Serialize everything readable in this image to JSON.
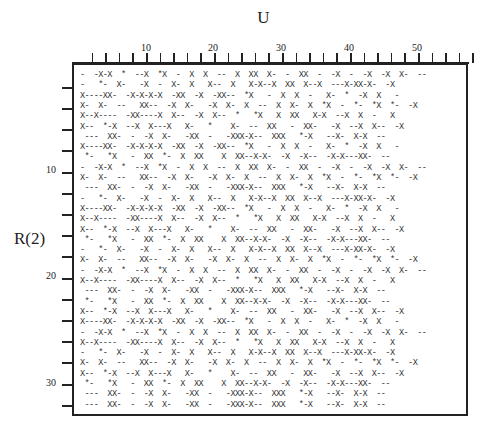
{
  "chart_data": {
    "type": "table",
    "title": "U",
    "xlabel": "U",
    "ylabel": "R(2)",
    "x_tick_labels": [
      "10",
      "20",
      "30",
      "40",
      "50"
    ],
    "y_tick_labels": [
      "10",
      "20",
      "30"
    ],
    "xlim": [
      1,
      58
    ],
    "ylim": [
      1,
      33
    ],
    "symbols": {
      "X": "x",
      "-": "dash",
      "*": "asterisk"
    },
    "patterns": {
      "P1": "-  -X-X  *  --X  *X  -  X  X  --  X  XX  X-  -  XX  -  -X  -  -X  -X  X-  --",
      "P2": "-   *-  X-   -X  -  X-  X   X--  X   X-X--X  XX  X--X  ---X-XX-X-  -X",
      "P3": "X----XX-  -X-X-X-X  -XX  -X  -XX--  *X   -  X  X  -   X-  *  -X  X   -",
      "P4": "X-  X-  --   XX--  -X  X-   -X  X-  X  --  X  X-  X  *X  -  *-  *X  *-  -X",
      "P5": "X--X----  -XX----X  X--  -X  X--  *   *X   X  XX   X-X  --X  X  -   X",
      "P6": "X--  *-X  --X  X---X   X-   *    X-  --  XX   -  XX-   -X  --X  X--  -X",
      "P7": " ---  XX-  -  -X  X-   -XX  -   -XXX-X--  XXX   *-X   --X-  X-X  --",
      "P8": " *-   *X   -  XX  *-  X  XX    X  XX--X-X-  -X  -X--  -X-X---XX-  --"
    },
    "row_patterns": [
      "P1",
      "P2",
      "P3",
      "P4",
      "P5",
      "P6",
      "P7",
      "P3",
      "P8",
      "P1",
      "P4",
      "P7",
      "P2",
      "P3",
      "P5",
      "P6",
      "P8",
      "P2",
      "P4",
      "P1",
      "P5",
      "P7",
      "P8",
      "P6",
      "P3",
      "P1",
      "P5",
      "P2",
      "P4",
      "P6",
      "P8",
      "P7",
      "P7"
    ]
  },
  "rows": [
    "-  -X-X  *  --X  *X  -  X  X  --  X  XX  X-  -  XX  -  -X  -  -X  -X  X-  --",
    "-   *-  X-   -X  -  X-  X   X--  X   X-X--X  XX  X--X  ---X-XX-X-  -X",
    "X----XX-  -X-X-X-X  -XX  -X  -XX--  *X   -  X  X  -   X-  *  -X  X   -",
    "X-  X-  --   XX--  -X  X-   -X  X-  X  --  X  X-  X  *X  -  *-  *X  *-  -X",
    "X--X----  -XX----X  X--  -X  X--  *   *X   X  XX   X-X  --X  X  -   X",
    "X--  *-X  --X  X---X   X-   *    X-  --  XX   -  XX-   -X  --X  X--  -X",
    " ---  XX-  -  -X  X-   -XX  -   -XXX-X--  XXX   *-X   --X-  X-X  --",
    "X----XX-  -X-X-X-X  -XX  -X  -XX--  *X   -  X  X  -   X-  *  -X  X   -",
    " *-   *X   -  XX  *-  X  XX    X  XX--X-X-  -X  -X--  -X-X---XX-  --",
    "-  -X-X  *  --X  *X  -  X  X  --  X  XX  X-  -  XX  -  -X  -  -X  -X  X-  --",
    "X-  X-  --   XX--  -X  X-   -X  X-  X  --  X  X-  X  *X  -  *-  *X  *-  -X",
    " ---  XX-  -  -X  X-   -XX  -   -XXX-X--  XXX   *-X   --X-  X-X  --",
    "-   *-  X-   -X  -  X-  X   X--  X   X-X--X  XX  X--X  ---X-XX-X-  -X",
    "X----XX-  -X-X-X-X  -XX  -X  -XX--  *X   -  X  X  -   X-  *  -X  X   -",
    "X--X----  -XX----X  X--  -X  X--  *   *X   X  XX   X-X  --X  X  -   X",
    "X--  *-X  --X  X---X   X-   *    X-  --  XX   -  XX-   -X  --X  X--  -X",
    " *-   *X   -  XX  *-  X  XX    X  XX--X-X-  -X  -X--  -X-X---XX-  --",
    "-   *-  X-   -X  -  X-  X   X--  X   X-X--X  XX  X--X  ---X-XX-X-  -X",
    "X-  X-  --   XX--  -X  X-   -X  X-  X  --  X  X-  X  *X  -  *-  *X  *-  -X",
    "-  -X-X  *  --X  *X  -  X  X  --  X  XX  X-  -  XX  -  -X  -  -X  -X  X-  --",
    "X--X----  -XX----X  X--  -X  X--  *   *X   X  XX   X-X  --X  X  -   X",
    " ---  XX-  -  -X  X-   -XX  -   -XXX-X--  XXX   *-X   --X-  X-X  --",
    " *-   *X   -  XX  *-  X  XX    X  XX--X-X-  -X  -X--  -X-X---XX-  --",
    "X--  *-X  --X  X---X   X-   *    X-  --  XX   -  XX-   -X  --X  X--  -X",
    "X----XX-  -X-X-X-X  -XX  -X  -XX--  *X   -  X  X  -   X-  *  -X  X   -",
    "-  -X-X  *  --X  *X  -  X  X  --  X  XX  X-  -  XX  -  -X  -  -X  -X  X-  --",
    "X--X----  -XX----X  X--  -X  X--  *   *X   X  XX   X-X  --X  X  -   X",
    "-   *-  X-   -X  -  X-  X   X--  X   X-X--X  XX  X--X  ---X-XX-X-  -X",
    "X-  X-  --   XX--  -X  X-   -X  X-  X  --  X  X-  X  *X  -  *-  *X  *-  -X",
    "X--  *-X  --X  X---X   X-   *    X-  --  XX   -  XX-   -X  --X  X--  -X",
    " *-   *X   -  XX  *-  X  XX    X  XX--X-X-  -X  -X--  -X-X---XX-  --",
    " ---  XX-  -  -X  X-   -XX  -   -XXX-X--  XXX   *-X   --X-  X-X  --",
    " ---  XX-  -  -X  X-   -XX  -   -XXX-X--  XXX   *-X   --X-  X-X  --"
  ],
  "labels": {
    "title": "U",
    "ylabel": "R(2)",
    "x10": "10",
    "x20": "20",
    "x30": "30",
    "x40": "40",
    "x50": "50",
    "y10": "10",
    "y20": "20",
    "y30": "30"
  }
}
